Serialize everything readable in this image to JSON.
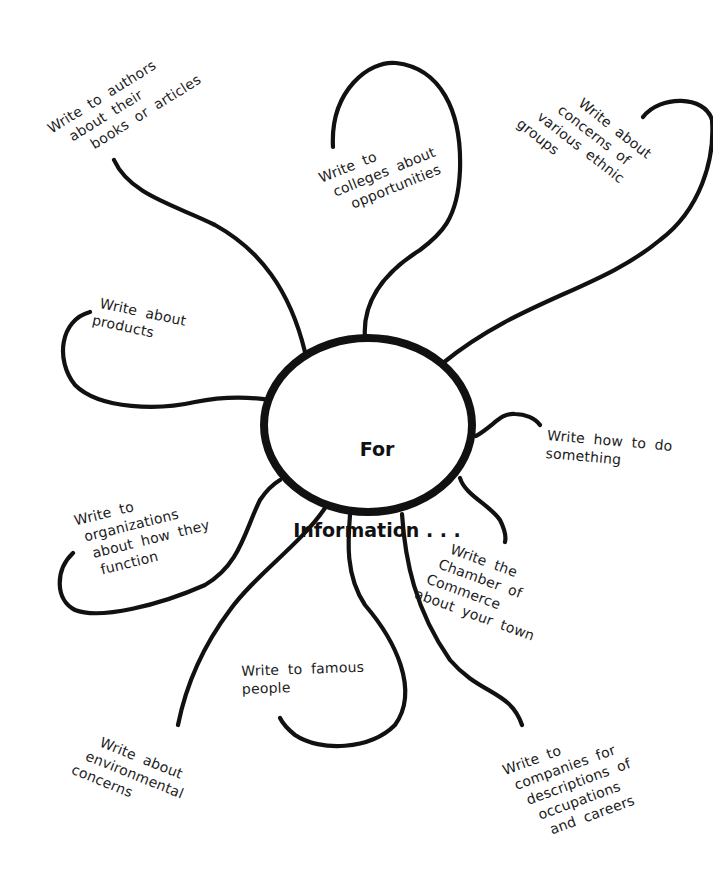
{
  "diagram": {
    "center": {
      "line1": "For",
      "line2": "Information . . ."
    },
    "branches": [
      {
        "id": "authors",
        "lines": [
          "Write to authors",
          "about their",
          "books or articles"
        ]
      },
      {
        "id": "colleges",
        "lines": [
          "Write to",
          "colleges about",
          "opportunities"
        ]
      },
      {
        "id": "ethnic",
        "lines": [
          "Write about",
          "concerns of",
          "various ethnic",
          "groups"
        ]
      },
      {
        "id": "products",
        "lines": [
          "Write about",
          "products"
        ]
      },
      {
        "id": "how-to",
        "lines": [
          "Write how to do",
          "something"
        ]
      },
      {
        "id": "organizations",
        "lines": [
          "Write to",
          "organizations",
          "about how they",
          "function"
        ]
      },
      {
        "id": "chamber",
        "lines": [
          "Write the",
          "Chamber of",
          "Commerce",
          "about your town"
        ]
      },
      {
        "id": "famous",
        "lines": [
          "Write to famous",
          "people"
        ]
      },
      {
        "id": "environmental",
        "lines": [
          "Write about",
          "environmental",
          "concerns"
        ]
      },
      {
        "id": "companies",
        "lines": [
          "Write to",
          "companies for",
          "descriptions of",
          "occupations",
          "and careers"
        ]
      }
    ]
  }
}
